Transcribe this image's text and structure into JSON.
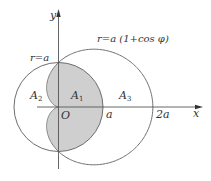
{
  "diagram": {
    "colors": {
      "background": "#ffffff",
      "stroke": "#6e6e6e",
      "axis": "#555555",
      "shade": "#cfcfcf",
      "text": "#333333"
    },
    "geometry": {
      "origin_px": [
        58.5,
        107
      ],
      "a_px": 44.5,
      "cardioid_x_stretch": 1.06
    },
    "labels": {
      "y_axis": "y",
      "x_axis": "x",
      "origin": "O",
      "a_tick": "a",
      "two_a_tick": "2a",
      "circle_eq": "r=a",
      "cardioid_eq": "r=a (1+cos φ)",
      "region_A1": {
        "main": "A",
        "sub": "1"
      },
      "region_A2": {
        "main": "A",
        "sub": "2"
      },
      "region_A3": {
        "main": "A",
        "sub": "3"
      }
    }
  }
}
